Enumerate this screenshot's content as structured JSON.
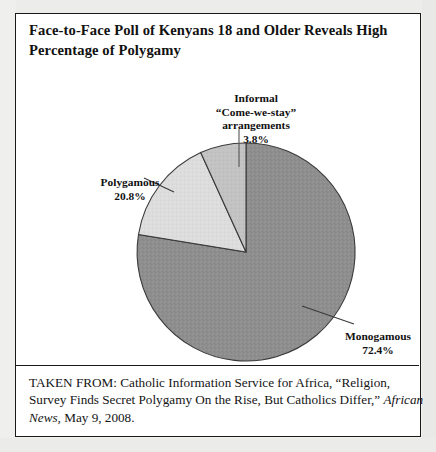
{
  "figure": {
    "title_lines": [
      "Face-to-Face Poll of Kenyans 18 and Older Reveals High",
      "Percentage  of Polygamy"
    ],
    "source_lines": [
      "TAKEN FROM: Catholic Information Service for Africa, “Religion,",
      "Survey Finds Secret Polygamy On the Rise, But Catholics Differ,” ",
      "News, May 9, 2008."
    ],
    "source_italic_inline": "African"
  },
  "chart_data": {
    "type": "pie",
    "title": "Face-to-Face Poll of Kenyans 18 and Older Reveals High Percentage  of Polygamy",
    "categories": [
      "Monogamous",
      "Informal “Come-we-stay” arrangements",
      "Polygamous"
    ],
    "values": [
      72.4,
      3.8,
      20.8
    ],
    "value_labels": [
      "72.4%",
      "3.8%",
      "20.8%"
    ],
    "units": "percent",
    "legend": "none",
    "slice_colors": [
      "#8e8e8e",
      "#c2c2c2",
      "#dcdcdc"
    ],
    "start_angle_deg": 0,
    "direction": "clockwise",
    "labels": {
      "monogamous": {
        "lines": [
          "Monogamous",
          "72.4%"
        ],
        "value": 72.4
      },
      "polygamous": {
        "lines": [
          "Polygamous",
          "20.8%"
        ],
        "value": 20.8
      },
      "informal": {
        "lines": [
          "Informal",
          "“Come-we-stay”",
          "arrangements",
          "3.8%"
        ],
        "value": 3.8
      }
    }
  }
}
